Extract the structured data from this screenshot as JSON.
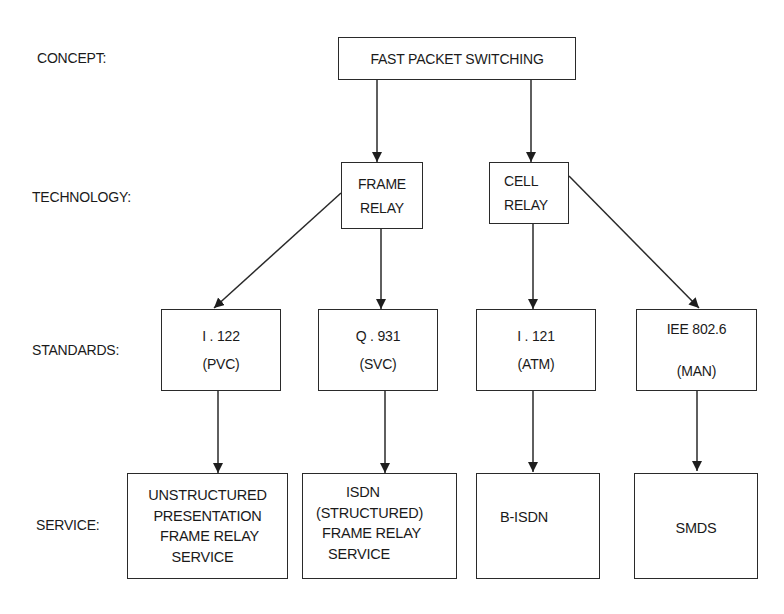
{
  "diagram": {
    "row_labels": {
      "concept": "CONCEPT:",
      "technology": "TECHNOLOGY:",
      "standards": "STANDARDS:",
      "service": "SERVICE:"
    },
    "concept": {
      "fast_packet_switching": [
        "FAST PACKET SWITCHING"
      ]
    },
    "technology": {
      "frame_relay": [
        "FRAME",
        "RELAY"
      ],
      "cell_relay": [
        "CELL",
        "RELAY"
      ]
    },
    "standards": {
      "i122": [
        "I . 122",
        "(PVC)"
      ],
      "q931": [
        "Q . 931",
        "(SVC)"
      ],
      "i121": [
        "I . 121",
        "(ATM)"
      ],
      "ieee": [
        "IEE 802.6",
        "(MAN)"
      ]
    },
    "service": {
      "unstructured": [
        "UNSTRUCTURED",
        "PRESENTATION",
        "FRAME RELAY",
        "SERVICE"
      ],
      "isdn": [
        "ISDN",
        "(STRUCTURED)",
        "FRAME RELAY",
        "SERVICE"
      ],
      "bisdn": [
        "B-ISDN"
      ],
      "smds": [
        "SMDS"
      ]
    },
    "edges": [
      {
        "from": "FAST PACKET SWITCHING",
        "to": "FRAME RELAY"
      },
      {
        "from": "FAST PACKET SWITCHING",
        "to": "CELL RELAY"
      },
      {
        "from": "FRAME RELAY",
        "to": "I . 122 (PVC)"
      },
      {
        "from": "FRAME RELAY",
        "to": "Q . 931 (SVC)"
      },
      {
        "from": "CELL RELAY",
        "to": "I . 121 (ATM)"
      },
      {
        "from": "CELL RELAY",
        "to": "IEE 802.6 (MAN)"
      },
      {
        "from": "I . 122 (PVC)",
        "to": "UNSTRUCTURED PRESENTATION FRAME RELAY SERVICE"
      },
      {
        "from": "Q . 931 (SVC)",
        "to": "ISDN (STRUCTURED) FRAME RELAY SERVICE"
      },
      {
        "from": "I . 121 (ATM)",
        "to": "B-ISDN"
      },
      {
        "from": "IEE 802.6 (MAN)",
        "to": "SMDS"
      }
    ],
    "colors": {
      "background": "#ffffff",
      "stroke": "#2a2a2a",
      "text": "#1a1a1a"
    }
  }
}
